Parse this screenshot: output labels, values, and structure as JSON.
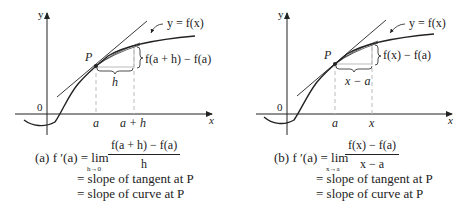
{
  "panels": [
    {
      "id": "a",
      "axis_y_label": "y",
      "axis_x_label": "x",
      "origin_label": "0",
      "point_label": "P",
      "curve_label": "y = f(x)",
      "rise_label": "f(a + h) − f(a)",
      "run_label": "h",
      "tick_a_label": "a",
      "tick_b_label": "a + h",
      "caption": {
        "prefix": "(a) f ′(a) = lim",
        "limit_sub": "h→0",
        "numerator": "f(a + h) − f(a)",
        "denominator": "h",
        "line2": "= slope of tangent at P",
        "line3": "= slope of curve at P"
      }
    },
    {
      "id": "b",
      "axis_y_label": "y",
      "axis_x_label": "x",
      "origin_label": "0",
      "point_label": "P",
      "curve_label": "y = f(x)",
      "rise_label": "f(x) − f(a)",
      "run_label": "x − a",
      "tick_a_label": "a",
      "tick_b_label": "x",
      "caption": {
        "prefix": "(b) f ′(a) = lim",
        "limit_sub": "x→a",
        "numerator": "f(x) − f(a)",
        "denominator": "x − a",
        "line2": "= slope of tangent at P",
        "line3": "= slope of curve at P"
      }
    }
  ],
  "colors": {
    "ink": "#222222",
    "guide": "#bbbbbb"
  }
}
